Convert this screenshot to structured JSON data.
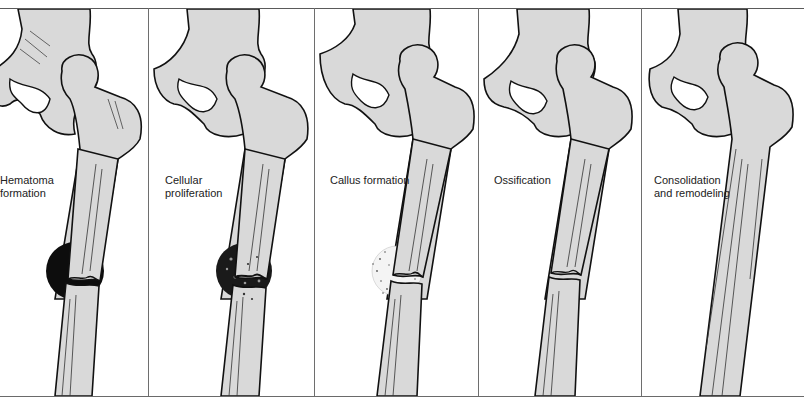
{
  "figure": {
    "colors": {
      "bone_fill": "#d9d9d9",
      "outline": "#111111",
      "hematoma": "#0d0d0d",
      "divider": "#6e6e6e",
      "background": "#ffffff"
    },
    "panels": [
      {
        "id": "hematoma",
        "label_line1": "Hematoma",
        "label_line2": "formation",
        "label_visible": "Hematoma\nformation",
        "fracture_marker": "hematoma-solid"
      },
      {
        "id": "cellular",
        "label_line1": "Cellular",
        "label_line2": "proliferation",
        "label_visible": "Cellular\nproliferation",
        "fracture_marker": "dark-speckled"
      },
      {
        "id": "callus",
        "label_line1": "Callus formation",
        "label_line2": "",
        "label_visible": "Callus formation",
        "fracture_marker": "light-speckled"
      },
      {
        "id": "ossification",
        "label_line1": "Ossification",
        "label_line2": "",
        "label_visible": "Ossification",
        "fracture_marker": "none"
      },
      {
        "id": "remodeling",
        "label_line1": "Consolidation",
        "label_line2": "and remodeling",
        "label_visible": "Consolidation\nand remodeling",
        "fracture_marker": "healed"
      }
    ]
  }
}
